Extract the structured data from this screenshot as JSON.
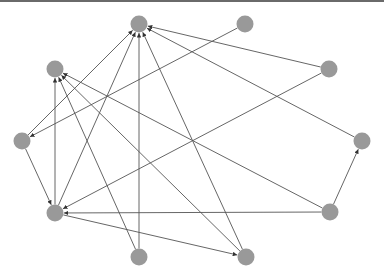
{
  "diagram": {
    "type": "directed-graph",
    "node_color": "#999999",
    "edge_color": "#555555",
    "background": "#ffffff",
    "node_radius": 8.5,
    "nodes": [
      {
        "id": "A",
        "x": 139,
        "y": 24
      },
      {
        "id": "B",
        "x": 245,
        "y": 24
      },
      {
        "id": "C",
        "x": 55,
        "y": 69
      },
      {
        "id": "D",
        "x": 329,
        "y": 69
      },
      {
        "id": "E",
        "x": 22,
        "y": 141
      },
      {
        "id": "F",
        "x": 362,
        "y": 141
      },
      {
        "id": "G",
        "x": 55,
        "y": 213
      },
      {
        "id": "H",
        "x": 330,
        "y": 212
      },
      {
        "id": "I",
        "x": 139,
        "y": 257
      },
      {
        "id": "J",
        "x": 246,
        "y": 257
      }
    ],
    "edges": [
      {
        "from": "E",
        "to": "A"
      },
      {
        "from": "G",
        "to": "A"
      },
      {
        "from": "I",
        "to": "A"
      },
      {
        "from": "J",
        "to": "A"
      },
      {
        "from": "D",
        "to": "A"
      },
      {
        "from": "F",
        "to": "A"
      },
      {
        "from": "B",
        "to": "E"
      },
      {
        "from": "E",
        "to": "G"
      },
      {
        "from": "G",
        "to": "C"
      },
      {
        "from": "I",
        "to": "C"
      },
      {
        "from": "J",
        "to": "C"
      },
      {
        "from": "H",
        "to": "C"
      },
      {
        "from": "D",
        "to": "G"
      },
      {
        "from": "H",
        "to": "G"
      },
      {
        "from": "G",
        "to": "J"
      },
      {
        "from": "H",
        "to": "F"
      }
    ]
  }
}
